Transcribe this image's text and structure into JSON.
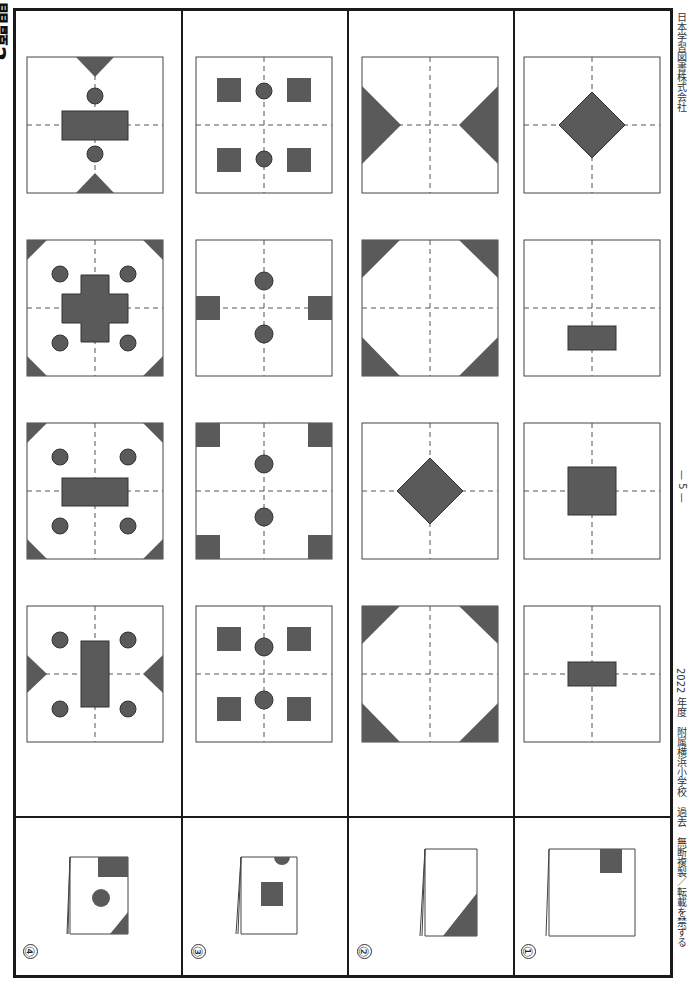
{
  "page": {
    "title": "問題2",
    "page_number": "— 5 —",
    "footer_left": "2022 年度　附属横浜小学校　過去　無断複製／転載を禁ずる",
    "footer_right": "日本学習図書株式会社"
  },
  "colors": {
    "fill": "#5a5a5a",
    "line": "#333333",
    "dash": "#555555",
    "frame": "#1a1a1a"
  },
  "questions": [
    {
      "number": "①",
      "folded_paper": "rectangle folded once, square cut at top edge",
      "options": [
        {
          "index": 1,
          "shapes": "small vertical rectangle at center"
        },
        {
          "index": 2,
          "shapes": "square at center"
        },
        {
          "index": 3,
          "shapes": "vertical rectangle in lower-right of center"
        },
        {
          "index": 4,
          "shapes": "diamond at center"
        }
      ]
    },
    {
      "number": "②",
      "folded_paper": "square folded, triangle cut at bottom-right corner",
      "options": [
        {
          "index": 1,
          "shapes": "four corner triangles"
        },
        {
          "index": 2,
          "shapes": "diamond at center"
        },
        {
          "index": 3,
          "shapes": "corner triangles top, half triangles lower"
        },
        {
          "index": 4,
          "shapes": "triangles at top and bottom center"
        }
      ]
    },
    {
      "number": "③",
      "folded_paper": "square folded twice, semicircle at top, square in middle",
      "options": [
        {
          "index": 1,
          "shapes": "four squares and two circles"
        },
        {
          "index": 2,
          "shapes": "four corner squares and two circles"
        },
        {
          "index": 3,
          "shapes": "two edge squares and two circles"
        },
        {
          "index": 4,
          "shapes": "four squares and two circles on axis"
        }
      ]
    },
    {
      "number": "④",
      "folded_paper": "square folded twice, rectangle top-right, circle, triangle bottom-right",
      "options": [
        {
          "index": 1,
          "shapes": "rectangle, four circles, edge triangles"
        },
        {
          "index": 2,
          "shapes": "rectangle, four circles, corner triangles"
        },
        {
          "index": 3,
          "shapes": "cross, four circles, corner triangles"
        },
        {
          "index": 4,
          "shapes": "rectangle, two circles, edge triangles"
        }
      ]
    }
  ]
}
